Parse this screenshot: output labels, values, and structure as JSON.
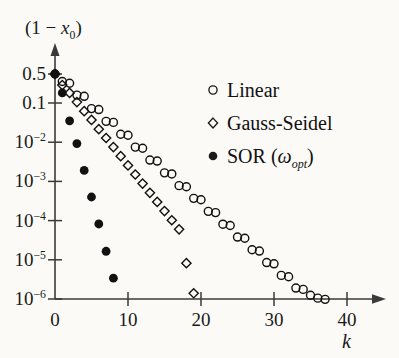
{
  "chart_data": {
    "type": "scatter",
    "title": "",
    "ylabel": "(1 − x₀)",
    "xlabel": "k",
    "xlim": [
      0,
      42
    ],
    "ylim_log": [
      -6.3,
      -0.18
    ],
    "grid": false,
    "legend_position": "upper right",
    "yticks": [
      {
        "value": 0.5,
        "label": "0.5",
        "mantissa": "0.5",
        "exp": ""
      },
      {
        "value": 0.1,
        "label": "0.1",
        "mantissa": "0.1",
        "exp": ""
      },
      {
        "value": 0.01,
        "label": "10-2",
        "mantissa": "10",
        "exp": "−2"
      },
      {
        "value": 0.001,
        "label": "10-3",
        "mantissa": "10",
        "exp": "−3"
      },
      {
        "value": 0.0001,
        "label": "10-4",
        "mantissa": "10",
        "exp": "−4"
      },
      {
        "value": 1e-05,
        "label": "10-5",
        "mantissa": "10",
        "exp": "−5"
      },
      {
        "value": 1e-06,
        "label": "10-6",
        "mantissa": "10",
        "exp": "−6"
      }
    ],
    "xticks": [
      {
        "value": 0,
        "label": "0"
      },
      {
        "value": 10,
        "label": "10"
      },
      {
        "value": 20,
        "label": "20"
      },
      {
        "value": 30,
        "label": "30"
      },
      {
        "value": 40,
        "label": "40"
      }
    ],
    "series": [
      {
        "name": "Linear",
        "marker": "open-circle",
        "color": "#111111",
        "points": [
          [
            0,
            0.5
          ],
          [
            1,
            0.33
          ],
          [
            2,
            0.3
          ],
          [
            3,
            0.155
          ],
          [
            4,
            0.145
          ],
          [
            5,
            0.072
          ],
          [
            6,
            0.068
          ],
          [
            7,
            0.034
          ],
          [
            8,
            0.032
          ],
          [
            9,
            0.016
          ],
          [
            10,
            0.015
          ],
          [
            11,
            0.0075
          ],
          [
            12,
            0.007
          ],
          [
            13,
            0.0035
          ],
          [
            14,
            0.0033
          ],
          [
            15,
            0.00165
          ],
          [
            16,
            0.00155
          ],
          [
            17,
            0.00078
          ],
          [
            18,
            0.00073
          ],
          [
            19,
            0.00037
          ],
          [
            20,
            0.00034
          ],
          [
            21,
            0.000172
          ],
          [
            22,
            0.00016
          ],
          [
            23,
            8.1e-05
          ],
          [
            24,
            7.5e-05
          ],
          [
            25,
            3.8e-05
          ],
          [
            26,
            3.55e-05
          ],
          [
            27,
            1.8e-05
          ],
          [
            28,
            1.67e-05
          ],
          [
            29,
            8.5e-06
          ],
          [
            30,
            7.9e-06
          ],
          [
            31,
            4e-06
          ],
          [
            32,
            3.7e-06
          ],
          [
            33,
            1.9e-06
          ],
          [
            34,
            1.76e-06
          ],
          [
            35,
            1.25e-06
          ],
          [
            36,
            1.05e-06
          ],
          [
            37,
            9.8e-07
          ]
        ]
      },
      {
        "name": "Gauss-Seidel",
        "marker": "open-diamond",
        "color": "#111111",
        "points": [
          [
            0,
            0.5
          ],
          [
            1,
            0.27
          ],
          [
            2,
            0.175
          ],
          [
            3,
            0.105
          ],
          [
            4,
            0.062
          ],
          [
            5,
            0.037
          ],
          [
            6,
            0.0215
          ],
          [
            7,
            0.0128
          ],
          [
            8,
            0.0075
          ],
          [
            9,
            0.0044
          ],
          [
            10,
            0.00255
          ],
          [
            11,
            0.0015
          ],
          [
            12,
            0.00088
          ],
          [
            13,
            0.00051
          ],
          [
            14,
            0.0003
          ],
          [
            15,
            0.000175
          ],
          [
            16,
            0.000102
          ],
          [
            17,
            6e-05
          ],
          [
            18,
            8.2e-06
          ],
          [
            19,
            1.4e-06
          ]
        ]
      },
      {
        "name": "SOR (wopt)",
        "marker": "filled-circle",
        "color": "#111111",
        "points": [
          [
            0,
            0.5
          ],
          [
            1,
            0.175
          ],
          [
            2,
            0.035
          ],
          [
            3,
            0.0092
          ],
          [
            4,
            0.0019
          ],
          [
            5,
            0.0004
          ],
          [
            6,
            8.2e-05
          ],
          [
            7,
            1.65e-05
          ],
          [
            8,
            3.4e-06
          ]
        ]
      }
    ]
  },
  "legend": {
    "items": [
      {
        "label": "Linear",
        "marker": "open-circle"
      },
      {
        "label": "Gauss-Seidel",
        "marker": "open-diamond"
      },
      {
        "label_pre": "SOR (",
        "label_sym": "ω",
        "label_sub": "opt",
        "label_post": ")",
        "marker": "filled-circle"
      }
    ]
  },
  "axis_titles": {
    "y_pre": "(1 − ",
    "y_var": "x",
    "y_sub": "0",
    "y_post": ")",
    "x": "k"
  },
  "colors": {
    "ink": "#1a1a1a",
    "axis": "#3a3a3a",
    "background": "#fbfaf7"
  }
}
